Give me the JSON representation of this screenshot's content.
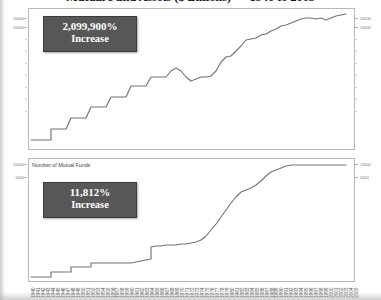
{
  "title": "Mutual Fund Assets ($ Billions) — 1940 to 2005",
  "panels": {
    "top": {
      "callout": {
        "line1": "2,099,900%",
        "line2": "Increase"
      },
      "y_labels": [
        "20000",
        "10000"
      ]
    },
    "bottom": {
      "caption": "Number of Mutual Funds",
      "callout": {
        "line1": "11,812%",
        "line2": "Increase"
      },
      "y_labels": [
        "10000",
        "5000"
      ]
    }
  },
  "chart_data": [
    {
      "type": "line",
      "title": "Mutual Fund Assets ($ Billions) — 1940 to 2005",
      "ylabel": "Mutual Fund Assets ($ Billions)",
      "xlabel": "Year",
      "ylim": [
        0,
        24000
      ],
      "yticks": [
        10000,
        20000
      ],
      "ytick_labels": [
        "10000",
        "20000"
      ],
      "grid": false,
      "legend": false,
      "annotation": "2,099,900% Increase",
      "x": [
        1940,
        1941,
        1942,
        1943,
        1944,
        1945,
        1946,
        1947,
        1948,
        1949,
        1950,
        1951,
        1952,
        1953,
        1954,
        1955,
        1956,
        1957,
        1958,
        1959,
        1960,
        1961,
        1962,
        1963,
        1964,
        1965,
        1966,
        1967,
        1968,
        1969,
        1970,
        1971,
        1972,
        1973,
        1974,
        1975,
        1976,
        1977,
        1978,
        1979,
        1980,
        1981,
        1982,
        1983,
        1984,
        1985,
        1986,
        1987,
        1988,
        1989,
        1990,
        1991,
        1992,
        1993,
        1994,
        1995,
        1996,
        1997,
        1998,
        1999,
        2000,
        2001,
        2002,
        2003,
        2004,
        2005
      ],
      "values": [
        0.45,
        0.4,
        0.49,
        0.65,
        0.88,
        1.28,
        1.31,
        1.41,
        1.51,
        1.97,
        2.53,
        3.13,
        3.93,
        4.15,
        6.11,
        7.84,
        9.05,
        8.71,
        13.2,
        15.8,
        17.0,
        22.8,
        21.3,
        25.2,
        29.1,
        35.2,
        34.8,
        44.7,
        52.7,
        48.3,
        47.6,
        55.0,
        59.8,
        46.5,
        35.8,
        45.9,
        51.3,
        45.0,
        44.9,
        94.5,
        134.8,
        241.4,
        296.7,
        292.9,
        370.7,
        495.5,
        715.7,
        769.2,
        809.4,
        980.7,
        1065.2,
        1393.2,
        1642.5,
        2070.0,
        2155.3,
        2811.3,
        3525.8,
        4468.2,
        5525.2,
        6846.3,
        6964.6,
        6975.0,
        6383.5,
        7414.4,
        8106.9,
        8905.2
      ],
      "yscale": "log"
    },
    {
      "type": "line",
      "title": "Number of Mutual Funds",
      "ylabel": "Number of Mutual Funds",
      "xlabel": "Year",
      "ylim": [
        0,
        11000
      ],
      "yticks": [
        5000,
        10000
      ],
      "ytick_labels": [
        "5000",
        "10000"
      ],
      "grid": false,
      "legend": false,
      "annotation": "11,812% Increase",
      "x": [
        1940,
        1941,
        1942,
        1943,
        1944,
        1945,
        1946,
        1947,
        1948,
        1949,
        1950,
        1951,
        1952,
        1953,
        1954,
        1955,
        1956,
        1957,
        1958,
        1959,
        1960,
        1961,
        1962,
        1963,
        1964,
        1965,
        1966,
        1967,
        1968,
        1969,
        1970,
        1971,
        1972,
        1973,
        1974,
        1975,
        1976,
        1977,
        1978,
        1979,
        1980,
        1981,
        1982,
        1983,
        1984,
        1985,
        1986,
        1987,
        1988,
        1989,
        1990,
        1991,
        1992,
        1993,
        1994,
        1995,
        1996,
        1997,
        1998,
        1999,
        2000,
        2001,
        2002,
        2003,
        2004,
        2005
      ],
      "values": [
        68,
        68,
        68,
        68,
        73,
        73,
        74,
        80,
        87,
        91,
        98,
        103,
        110,
        110,
        115,
        125,
        135,
        143,
        151,
        155,
        161,
        170,
        169,
        165,
        160,
        170,
        182,
        204,
        240,
        269,
        361,
        392,
        410,
        421,
        431,
        426,
        452,
        477,
        505,
        526,
        564,
        665,
        857,
        1026,
        1243,
        1528,
        1835,
        2312,
        2737,
        2917,
        3079,
        3403,
        3824,
        4534,
        5325,
        5725,
        6248,
        6684,
        7314,
        7791,
        8155,
        8305,
        8244,
        8126,
        8041,
        7977
      ],
      "yscale": "linear"
    }
  ],
  "xtick_labels": [
    "1940",
    "1941",
    "1942",
    "1943",
    "1944",
    "1945",
    "1946",
    "1947",
    "1948",
    "1949",
    "1950",
    "1951",
    "1952",
    "1953",
    "1954",
    "1955",
    "1956",
    "1957",
    "1958",
    "1959",
    "1960",
    "1961",
    "1962",
    "1963",
    "1964",
    "1965",
    "1966",
    "1967",
    "1968",
    "1969",
    "1970",
    "1971",
    "1972",
    "1973",
    "1974",
    "1975",
    "1976",
    "1977",
    "1978",
    "1979",
    "1980",
    "1981",
    "1982",
    "1983",
    "1984",
    "1985",
    "1986",
    "1987",
    "1988",
    "1989",
    "1990",
    "1991",
    "1992",
    "1993",
    "1994",
    "1995",
    "1996",
    "1997",
    "1998",
    "1999",
    "2000",
    "2001",
    "2002",
    "2003",
    "2004",
    "2005"
  ]
}
